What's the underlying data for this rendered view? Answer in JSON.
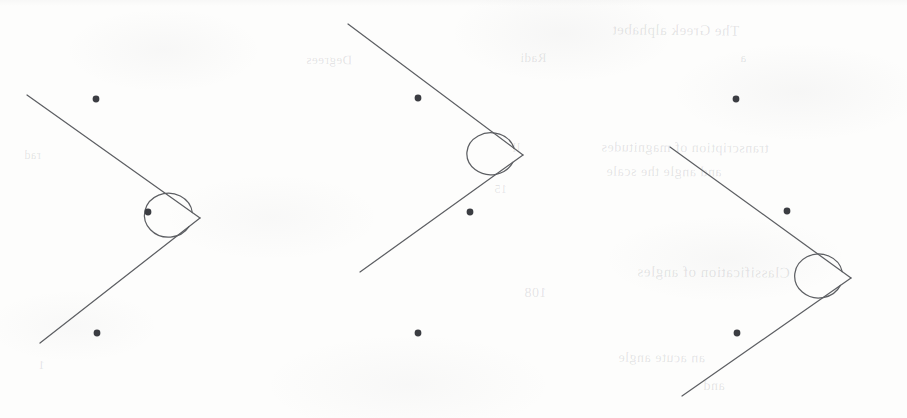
{
  "page": {
    "background_color": "#fdfdfc",
    "width": 907,
    "height": 418,
    "medium": "scanned textbook page",
    "figure_count": 3
  },
  "style": {
    "stroke_color": "#5d5f63",
    "dot_color": "#3b3d42",
    "stroke_width": 1.25,
    "dot_radius": 3.4
  },
  "ghost_text": [
    {
      "text": "The Greek alphabet",
      "x": 612,
      "y": 22,
      "size": 15,
      "rotate": -0.6
    },
    {
      "text": "a",
      "x": 740,
      "y": 50,
      "size": 13,
      "rotate": 0
    },
    {
      "text": "transcription of magnitudes",
      "x": 601,
      "y": 140,
      "size": 14,
      "rotate": -0.4
    },
    {
      "text": "and angle the scale",
      "x": 606,
      "y": 164,
      "size": 14,
      "rotate": -0.3
    },
    {
      "text": "Classification of angles",
      "x": 637,
      "y": 264,
      "size": 15,
      "rotate": -0.5
    },
    {
      "text": "an acute angle",
      "x": 618,
      "y": 350,
      "size": 14,
      "rotate": -0.4
    },
    {
      "text": "and",
      "x": 703,
      "y": 378,
      "size": 14,
      "rotate": -0.3
    },
    {
      "text": "Degrees",
      "x": 306,
      "y": 52,
      "size": 13,
      "rotate": -0.4
    },
    {
      "text": "Radi",
      "x": 520,
      "y": 50,
      "size": 13,
      "rotate": -0.3
    },
    {
      "text": "ll",
      "x": 512,
      "y": 140,
      "size": 13,
      "rotate": 0
    },
    {
      "text": "15",
      "x": 494,
      "y": 182,
      "size": 12,
      "rotate": 0
    },
    {
      "text": "108",
      "x": 524,
      "y": 285,
      "size": 14,
      "rotate": -0.3
    },
    {
      "text": "rad",
      "x": 24,
      "y": 148,
      "size": 12,
      "rotate": 0
    },
    {
      "text": "1",
      "x": 38,
      "y": 358,
      "size": 12,
      "rotate": 0
    }
  ],
  "figures": [
    {
      "id": "figure-1",
      "label": "reflex-angle-figure-1",
      "vertex": {
        "x": 200,
        "y": 218
      },
      "upper_ray_end": {
        "x": 27,
        "y": 95
      },
      "lower_ray_end": {
        "x": 40,
        "y": 343
      },
      "arc": {
        "center": {
          "x": 213,
          "y": 224
        },
        "rx": 24,
        "ry": 22,
        "description": "reflex-angle arc sweeping the exterior of the vertex"
      },
      "points": [
        {
          "name": "point-upper",
          "x": 96,
          "y": 99
        },
        {
          "name": "point-middle",
          "x": 148,
          "y": 212
        },
        {
          "name": "point-lower",
          "x": 97,
          "y": 333
        }
      ]
    },
    {
      "id": "figure-2",
      "label": "reflex-angle-figure-2",
      "vertex": {
        "x": 523,
        "y": 155
      },
      "upper_ray_end": {
        "x": 348,
        "y": 24
      },
      "lower_ray_end": {
        "x": 360,
        "y": 272
      },
      "arc": {
        "center": {
          "x": 536,
          "y": 157
        },
        "rx": 24,
        "ry": 21,
        "description": "reflex-angle arc sweeping the exterior of the vertex"
      },
      "points": [
        {
          "name": "point-upper",
          "x": 418,
          "y": 98
        },
        {
          "name": "point-middle",
          "x": 470,
          "y": 212
        },
        {
          "name": "point-lower",
          "x": 418,
          "y": 333
        }
      ]
    },
    {
      "id": "figure-3",
      "label": "reflex-angle-figure-3",
      "vertex": {
        "x": 851,
        "y": 278
      },
      "upper_ray_end": {
        "x": 670,
        "y": 147
      },
      "lower_ray_end": {
        "x": 682,
        "y": 396
      },
      "arc": {
        "center": {
          "x": 864,
          "y": 281
        },
        "rx": 24,
        "ry": 22,
        "description": "reflex-angle arc sweeping the exterior of the vertex"
      },
      "points": [
        {
          "name": "point-upper",
          "x": 736,
          "y": 99
        },
        {
          "name": "point-middle",
          "x": 787,
          "y": 211
        },
        {
          "name": "point-lower",
          "x": 737,
          "y": 333
        }
      ]
    }
  ]
}
